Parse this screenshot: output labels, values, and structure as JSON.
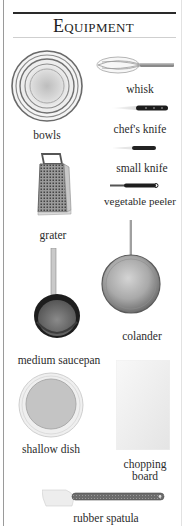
{
  "page": {
    "title": "Equipment",
    "title_first_letter": "E",
    "title_rest": "QUIPMENT"
  },
  "items": [
    {
      "id": "bowls",
      "label": "bowls",
      "icon": "bowls-icon"
    },
    {
      "id": "whisk",
      "label": "whisk",
      "icon": "whisk-icon"
    },
    {
      "id": "chefs-knife",
      "label": "chef's knife",
      "icon": "chefs-knife-icon"
    },
    {
      "id": "small-knife",
      "label": "small knife",
      "icon": "small-knife-icon"
    },
    {
      "id": "vegetable-peeler",
      "label": "vegetable peeler",
      "icon": "vegetable-peeler-icon"
    },
    {
      "id": "grater",
      "label": "grater",
      "icon": "grater-icon"
    },
    {
      "id": "medium-saucepan",
      "label": "medium saucepan",
      "icon": "saucepan-icon"
    },
    {
      "id": "colander",
      "label": "colander",
      "icon": "colander-icon"
    },
    {
      "id": "shallow-dish",
      "label": "shallow dish",
      "icon": "shallow-dish-icon"
    },
    {
      "id": "chopping-board",
      "label": "chopping board",
      "label_line1": "chopping",
      "label_line2": "board",
      "icon": "chopping-board-icon"
    },
    {
      "id": "rubber-spatula",
      "label": "rubber spatula",
      "icon": "rubber-spatula-icon"
    }
  ]
}
